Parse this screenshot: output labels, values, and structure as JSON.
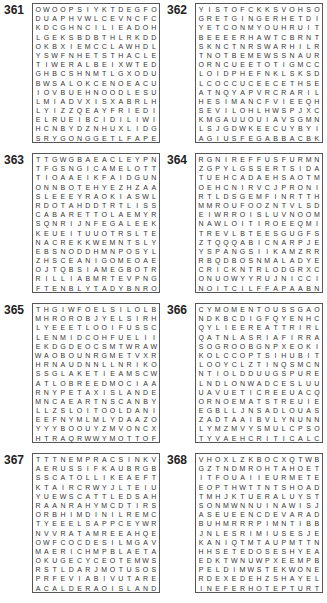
{
  "puzzles": [
    {
      "number": "361",
      "rows": [
        "OWOOPSIYKTDEGFO",
        "DUAPHVWLCEVNCFC",
        "KDCGHNCILIEADOH",
        "LGEKSBDBTHLRKDD",
        "OKBXIEMCCLAWHDL",
        "YSWFNHETSTHACLE",
        "TIWERALBEIXWTED",
        "GHBCSHNMTLGXODU",
        "BWSALOKCENOEACU",
        "IOVBUEHNOODLESU",
        "LMIADVXISXABRLH",
        "LYIZZQEAYFRIEDI",
        "ELRUEIBCIDILIWI",
        "HCNBYDZNHUXLIDG",
        "SRYGONGGETLFAPE"
      ]
    },
    {
      "number": "362",
      "rows": [
        "YISTOFCKKSVOHSO",
        "GRETGINGERHETDI",
        "YETCONMYOUHRUIT",
        "BEEEERHAWTCBRNT",
        "SKNCTNRSWARHILR",
        "TNOTBEMEWSSNAUR",
        "ORNCUEETOTIGMCC",
        "LOIDPHEFNKLSKSD",
        "LCOCCUCEECETHSE",
        "ATNQYAPVRCRARIL",
        "HESIMANCFVIEEQH",
        "SEVILOHLHWSPJXC",
        "KMGAUUOUIAVSGMN",
        "LSJGDWKEECUYBYI",
        "AGIUSFEGABBACBK"
      ]
    },
    {
      "number": "363",
      "rows": [
        "TTGWGBAEACLEYPN",
        "TFGSNGICAMELOTT",
        "TIOAAEIKFAIDGUN",
        "ONNBOTEHYEZHZAA",
        "SLEEEYRAOKIASWL",
        "RDOTAHDDTRTLISS",
        "CABARETTOLAEMYR",
        "SQNRIJNFEGALEEK",
        "KEUEITUUOTRSLTE",
        "NACREKKWEMNTSLY",
        "EBSNODDHMNPOSYL",
        "ZHSCEANIGOMEOAE",
        "OJTQBSIAMEGBOTR",
        "RILLIABMRTEVPNG",
        "FTENBLYTADYBNRO"
      ]
    },
    {
      "number": "364",
      "rows": [
        "RGNIREFFUSFURMN",
        "ZGPYLGSSERTSIDA",
        "TUEHCADAEHSAOTM",
        "OEHCNIRVCJPRONI",
        "RTLDSGEMFINRTTH",
        "MMROUFOOZNTVLSD",
        "EIWRROISLUVNOOM",
        "NAWLOITIROEEQMI",
        "TREVLBTEESGUGFS",
        "ZTQQQABICNARPJE",
        "YSPANGSIIKAMZRR",
        "RBQDBOSNMALADYE",
        "CRICKNTRLODGRXC",
        "ONUOWYYRUJNICCI",
        "NOITCILFFAPAABN"
      ]
    },
    {
      "number": "365",
      "rows": [
        "THGIWFOELSILOLB",
        "MHROROBJYELSIRH",
        "LYEEETLOOIFUSSC",
        "LENMIDCOHFUELII",
        "EKDGDEOCSMTWRAW",
        "WAOBOUNRGMETVXR",
        "HRNAUDNNLLNRIKO",
        "SSGLAKETIEAMSCW",
        "ATLOBREEDMOCIAA",
        "RNYPETAXISLANDE",
        "MNCAEARTNSCANBY",
        "LLZSLOITOOLDANI",
        "EEFNYMLMLYDAAZO",
        "YYYBOOUYZMVONCX",
        "HTRAQRWWYMOTTOF"
      ]
    },
    {
      "number": "366",
      "rows": [
        "CYMOMENTOUSSGAO",
        "NDKBCDIGFQYENHC",
        "QYLIEEREATTRIRL",
        "QATNLASRIAFIRRA",
        "SOGROOBGNPXEOKI",
        "KOLCCOPTSIHUBIT",
        "LOOYCLZTINQSMCN",
        "NTIOLDDUUGSPURE",
        "LNDLONWADCESLUU",
        "UAVUETICREEUACQ",
        "ORNOEMATSTREUIE",
        "EGBLLJNSADLOUAS",
        "ZADTAAIBVLYNUNN",
        "LYMZMVYSMULCPSO",
        "TYVAEHCRITICALC"
      ]
    },
    {
      "number": "367",
      "rows": [
        "TTTNEMPRACSINKV",
        "AERUSSIFKAUBRGB",
        "SSCATOLLIKEAEFT",
        "KTAIRCRWYJLTEIU",
        "YUEWSCATTLEDSAH",
        "RAANRAHYMCDTIRS",
        "ORBHIMDINILREMC",
        "TYEEELSAPPCEYWR",
        "NVVRATAMREEAHQE",
        "OWFCOCDESILMGAV",
        "MAERICHMPBLAETA",
        "OKUGECYCEOTEMWS",
        "RSTLDARJMOTUSOS",
        "PRFEVIABIVUTARE",
        "ACALDERAOISLAND"
      ]
    },
    {
      "number": "368",
      "rows": [
        "VHOXLZKBOCXQTWB",
        "GZTNDMROHTAHOET",
        "ITFOUAIIEURMETE",
        "EOPTHWTTNTSHOAD",
        "TMHJKTUERALUYST",
        "SONMWNNUINAWISJ",
        "ASEUEENCDEVARAD",
        "BUHMRRRPIMNTIBB",
        "JNLESRIMIUSESJE",
        "KANIQTMTAUPMTTN",
        "HHSETEDOSESHYEA",
        "EDKTWNUWPXEEMPB",
        "PELDIMWSTEKWONE",
        "RDEXEDEHZSHAYEL",
        "INEFERHOTEPTURT"
      ]
    }
  ]
}
